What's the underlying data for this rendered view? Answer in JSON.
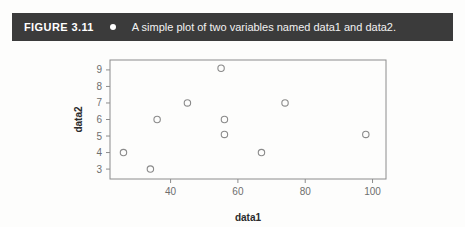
{
  "figure": {
    "label": "FIGURE 3.11",
    "separator_icon": "bullet-dot-icon",
    "caption": "A simple plot of two variables named data1 and data2.",
    "banner_color": "#3b3b3b",
    "banner_text_color": "#ffffff"
  },
  "chart_data": {
    "type": "scatter",
    "title": "",
    "xlabel": "data1",
    "ylabel": "data2",
    "xlim": [
      22,
      104
    ],
    "ylim": [
      2.4,
      9.6
    ],
    "xticks": [
      40,
      60,
      80,
      100
    ],
    "yticks": [
      3,
      4,
      5,
      6,
      7,
      8,
      9
    ],
    "grid": false,
    "legend": null,
    "marker": "open-circle",
    "marker_color": "#8a8a8a",
    "points": [
      {
        "x": 26,
        "y": 4.0
      },
      {
        "x": 34,
        "y": 3.0
      },
      {
        "x": 36,
        "y": 6.0
      },
      {
        "x": 45,
        "y": 7.0
      },
      {
        "x": 55,
        "y": 9.1
      },
      {
        "x": 56,
        "y": 6.0
      },
      {
        "x": 56,
        "y": 5.1
      },
      {
        "x": 67,
        "y": 4.0
      },
      {
        "x": 74,
        "y": 7.0
      },
      {
        "x": 98,
        "y": 5.1
      }
    ]
  }
}
